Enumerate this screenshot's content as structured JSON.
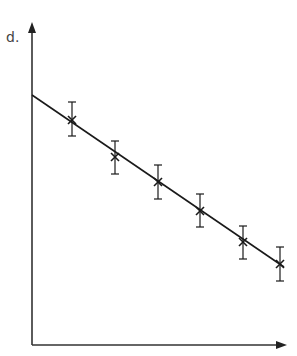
{
  "chart_data": {
    "type": "scatter",
    "title": "",
    "xlabel": "",
    "ylabel": "d.",
    "grid": false,
    "legend": null,
    "x": [
      1,
      2,
      3,
      4,
      5,
      6
    ],
    "series": [
      {
        "name": "measurements",
        "marker": "x",
        "values": [
          7.0,
          6.2,
          5.6,
          4.9,
          4.2,
          3.7
        ],
        "error": [
          0.8,
          0.8,
          0.8,
          0.8,
          0.8,
          0.8
        ]
      }
    ],
    "best_fit_line": {
      "intercept_at_y_axis": 7.5,
      "slope": -0.57
    },
    "pixel_layout": {
      "axis_origin": [
        32,
        345
      ],
      "y_axis_top": 22,
      "x_axis_right": 287,
      "points_px": [
        {
          "x": 72,
          "y": 120,
          "err_top": 102,
          "err_bottom": 136
        },
        {
          "x": 115,
          "y": 157,
          "err_top": 141,
          "err_bottom": 174
        },
        {
          "x": 158,
          "y": 182,
          "err_top": 165,
          "err_bottom": 199
        },
        {
          "x": 200,
          "y": 211,
          "err_top": 194,
          "err_bottom": 227
        },
        {
          "x": 243,
          "y": 242,
          "err_top": 226,
          "err_bottom": 259
        },
        {
          "x": 280,
          "y": 264,
          "err_top": 247,
          "err_bottom": 281
        }
      ],
      "line_px": {
        "x1": 32,
        "y1": 95,
        "x2": 284,
        "y2": 267
      }
    },
    "colors": {
      "ink": "#1a1a1a",
      "axis": "#333333"
    }
  },
  "axes": {
    "y_label": "d."
  }
}
